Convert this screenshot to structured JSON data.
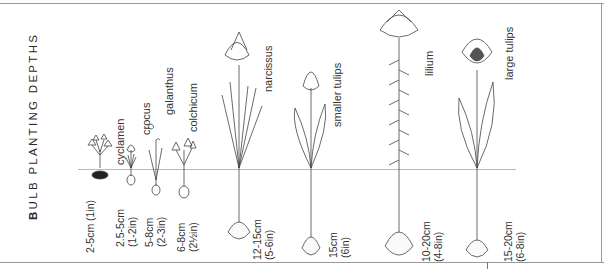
{
  "title": {
    "first_letter": "B",
    "rest": "ULB PLANTING DEPTHS"
  },
  "colors": {
    "ink": "#333333",
    "frame": "#9a9a9a",
    "ground_line": "#b8b8b8",
    "background": "#ffffff"
  },
  "plants": [
    {
      "name": "cyclamen",
      "depth_cm": "2-5cm (1in)",
      "depth_in": ""
    },
    {
      "name": "crocus",
      "depth_cm": "2.5-5cm",
      "depth_in": "(1-2in)"
    },
    {
      "name": "galanthus",
      "depth_cm": "5-8cm",
      "depth_in": "(2-3in)"
    },
    {
      "name": "colchicum",
      "depth_cm": "6-8cm",
      "depth_in": "(2½in)"
    },
    {
      "name": "narcissus",
      "depth_cm": "12-15cm",
      "depth_in": "(5-6in)"
    },
    {
      "name": "smaller tulips",
      "depth_cm": "15cm",
      "depth_in": "(6in)"
    },
    {
      "name": "lilium",
      "depth_cm": "10-20cm",
      "depth_in": "(4-8in)"
    },
    {
      "name": "large tulips",
      "depth_cm": "15-20cm",
      "depth_in": "(6-8in)"
    }
  ]
}
